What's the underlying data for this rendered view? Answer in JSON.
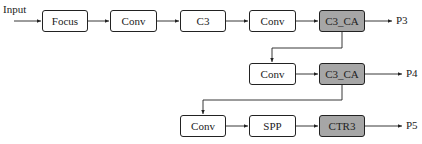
{
  "diagram": {
    "input_label": "Input",
    "row1": [
      {
        "id": "focus",
        "label": "Focus",
        "shaded": false
      },
      {
        "id": "conv1",
        "label": "Conv",
        "shaded": false
      },
      {
        "id": "c3",
        "label": "C3",
        "shaded": false
      },
      {
        "id": "conv2",
        "label": "Conv",
        "shaded": false
      },
      {
        "id": "c3ca1",
        "label": "C3_CA",
        "shaded": true
      }
    ],
    "row2": [
      {
        "id": "conv3",
        "label": "Conv",
        "shaded": false
      },
      {
        "id": "c3ca2",
        "label": "C3_CA",
        "shaded": true
      }
    ],
    "row3": [
      {
        "id": "conv4",
        "label": "Conv",
        "shaded": false
      },
      {
        "id": "spp",
        "label": "SPP",
        "shaded": false
      },
      {
        "id": "ctr3",
        "label": "CTR3",
        "shaded": true
      }
    ],
    "outputs": [
      "P3",
      "P4",
      "P5"
    ],
    "colors": {
      "shaded_fill": "#a6a6a6",
      "stroke": "#222222"
    }
  }
}
